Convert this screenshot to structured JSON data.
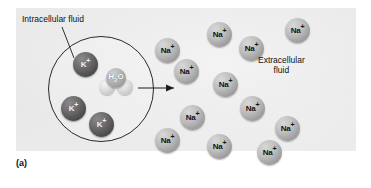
{
  "figure": {
    "caption": "(a)",
    "labels": {
      "intracellular": "Intracellular fluid",
      "extracellular_line1": "Extracellular",
      "extracellular_line2": "fluid"
    },
    "colors": {
      "panel_background": "#ececec",
      "potassium_ion": "#4c4c4c",
      "sodium_ion": "#9e9e9e",
      "water_molecule": "#b3b3b3",
      "membrane_stroke": "#2a2a2a",
      "text": "#111111"
    },
    "cell": {
      "membrane_label": "cell-membrane"
    },
    "water": {
      "formula_main": "H",
      "formula_sub": "2",
      "formula_tail": "O"
    },
    "ions": {
      "potassium": [
        {
          "label": "K",
          "charge": "+",
          "x": 73,
          "y": 52
        },
        {
          "label": "K",
          "charge": "+",
          "x": 61,
          "y": 96
        },
        {
          "label": "K",
          "charge": "+",
          "x": 89,
          "y": 112
        }
      ],
      "sodium": [
        {
          "label": "Na",
          "charge": "+",
          "x": 155,
          "y": 38
        },
        {
          "label": "Na",
          "charge": "+",
          "x": 174,
          "y": 59
        },
        {
          "label": "Na",
          "charge": "+",
          "x": 207,
          "y": 22
        },
        {
          "label": "Na",
          "charge": "+",
          "x": 239,
          "y": 36
        },
        {
          "label": "Na",
          "charge": "+",
          "x": 285,
          "y": 18
        },
        {
          "label": "Na",
          "charge": "+",
          "x": 213,
          "y": 72
        },
        {
          "label": "Na",
          "charge": "+",
          "x": 240,
          "y": 96
        },
        {
          "label": "Na",
          "charge": "+",
          "x": 180,
          "y": 105
        },
        {
          "label": "Na",
          "charge": "+",
          "x": 155,
          "y": 128
        },
        {
          "label": "Na",
          "charge": "+",
          "x": 207,
          "y": 134
        },
        {
          "label": "Na",
          "charge": "+",
          "x": 257,
          "y": 140
        },
        {
          "label": "Na",
          "charge": "+",
          "x": 275,
          "y": 116
        }
      ]
    },
    "arrow": {
      "name": "water-efflux-arrow"
    }
  }
}
